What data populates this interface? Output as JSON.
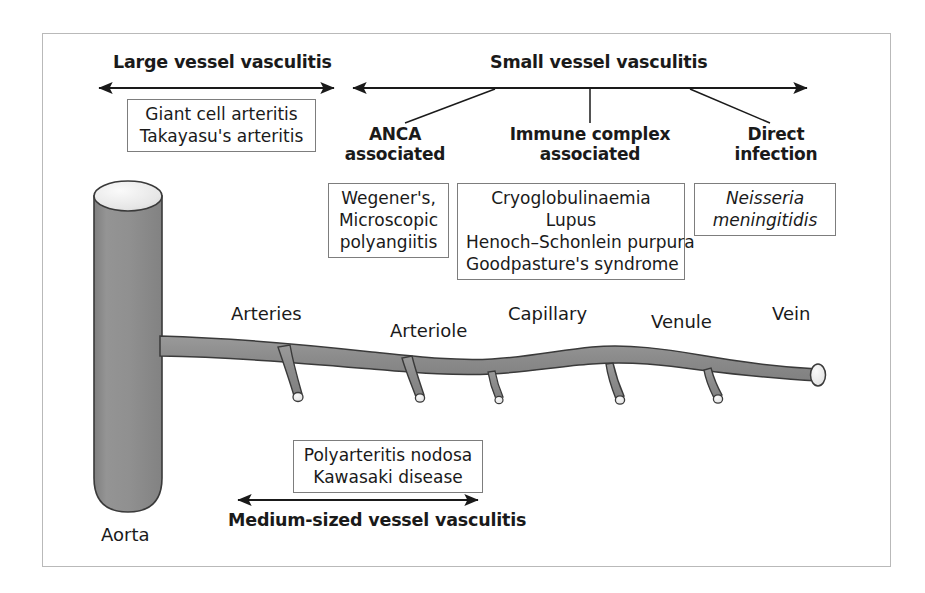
{
  "figure": {
    "border_color": "#b9b9b9",
    "vessel_fill": "#8e8e8e",
    "vessel_stroke": "#3a3a3a",
    "lumen_fill": "#eaeaea"
  },
  "headers": {
    "large_vessel": "Large vessel vasculitis",
    "small_vessel": "Small vessel vasculitis"
  },
  "categories": [
    {
      "line1": "ANCA",
      "line2": "associated"
    },
    {
      "line1": "Immune complex",
      "line2": "associated"
    },
    {
      "line1": "Direct",
      "line2": "infection"
    }
  ],
  "boxes": {
    "large_vessel": {
      "items": [
        "Giant cell arteritis",
        "Takayasu's arteritis"
      ]
    },
    "anca": {
      "items": [
        "Wegener's,",
        "Microscopic",
        "polyangiitis"
      ]
    },
    "immune_complex": {
      "items": [
        "Cryoglobulinaemia",
        "Lupus",
        "Henoch–Schonlein purpura",
        "Goodpasture's syndrome"
      ]
    },
    "direct_infection": {
      "items": [
        "Neisseria",
        "meningitidis"
      ],
      "italic": true
    },
    "medium_vessel": {
      "items": [
        "Polyarteritis nodosa",
        "Kawasaki disease"
      ]
    }
  },
  "vessel_labels": [
    {
      "text": "Arteries"
    },
    {
      "text": "Arteriole"
    },
    {
      "text": "Capillary"
    },
    {
      "text": "Venule"
    },
    {
      "text": "Vein"
    },
    {
      "text": "Aorta"
    }
  ],
  "bottom": {
    "label": "Medium-sized vessel vasculitis"
  }
}
